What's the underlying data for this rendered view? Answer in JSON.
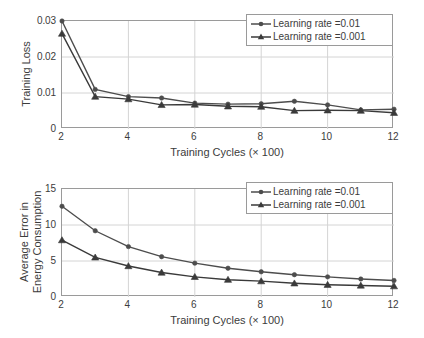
{
  "figure": {
    "series_colors": [
      "#4d4d4d",
      "#3a3a3a"
    ],
    "grid_color": "#d4d4d4",
    "axis_color": "#9a9a9a"
  },
  "charts": [
    {
      "id": "training-loss",
      "chart_data": {
        "type": "line",
        "title": "",
        "xlabel": "Training Cycles (× 100)",
        "ylabel": "Training Loss",
        "ylabel_lines": [
          "Training Loss"
        ],
        "x": [
          2,
          3,
          4,
          5,
          6,
          7,
          8,
          9,
          10,
          11,
          12
        ],
        "xlim": [
          2,
          12
        ],
        "ylim": [
          0,
          0.03
        ],
        "xticks": [
          2,
          4,
          6,
          8,
          10,
          12
        ],
        "xtick_labels": [
          "2",
          "4",
          "6",
          "8",
          "10",
          "12"
        ],
        "yticks": [
          0,
          0.01,
          0.02,
          0.03
        ],
        "ytick_labels": [
          "0",
          "0.01",
          "0.02",
          "0.03"
        ],
        "grid": true,
        "legend_position": "upper right",
        "series": [
          {
            "name": "Learning rate =0.01",
            "marker": "circle",
            "values": [
              0.03,
              0.011,
              0.009,
              0.0086,
              0.0072,
              0.0069,
              0.007,
              0.0077,
              0.0067,
              0.0053,
              0.0055
            ]
          },
          {
            "name": "Learning rate =0.001",
            "marker": "triangle",
            "values": [
              0.0265,
              0.009,
              0.0083,
              0.0067,
              0.0068,
              0.0063,
              0.0062,
              0.0051,
              0.0052,
              0.0051,
              0.0045
            ]
          }
        ]
      }
    },
    {
      "id": "average-error-energy-consumption",
      "chart_data": {
        "type": "line",
        "title": "",
        "xlabel": "Training Cycles (× 100)",
        "ylabel": "Average Error in Energy Consumption",
        "ylabel_lines": [
          "Average Error in",
          "Energy Consumption"
        ],
        "x": [
          2,
          3,
          4,
          5,
          6,
          7,
          8,
          9,
          10,
          11,
          12
        ],
        "xlim": [
          2,
          12
        ],
        "ylim": [
          0,
          15
        ],
        "xticks": [
          2,
          4,
          6,
          8,
          10,
          12
        ],
        "xtick_labels": [
          "2",
          "4",
          "6",
          "8",
          "10",
          "12"
        ],
        "yticks": [
          0,
          5,
          10,
          15
        ],
        "ytick_labels": [
          "0",
          "5",
          "10",
          "15"
        ],
        "grid": true,
        "legend_position": "upper right",
        "series": [
          {
            "name": "Learning rate =0.01",
            "marker": "circle",
            "values": [
              12.6,
              9.2,
              7.0,
              5.6,
              4.7,
              4.0,
              3.5,
              3.1,
              2.8,
              2.5,
              2.3
            ]
          },
          {
            "name": "Learning rate =0.001",
            "marker": "triangle",
            "values": [
              7.9,
              5.5,
              4.3,
              3.4,
              2.8,
              2.4,
              2.2,
              1.9,
              1.7,
              1.6,
              1.5
            ]
          }
        ]
      }
    }
  ]
}
